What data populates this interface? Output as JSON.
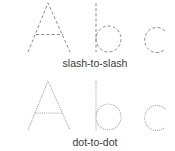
{
  "letters": [
    "A",
    "b",
    "c"
  ],
  "styles": [
    {
      "id": "slash",
      "label": "slash-to-slash",
      "stroke": "#8a8a8a",
      "dash": "3 2.2",
      "linecap": "butt"
    },
    {
      "id": "dot",
      "label": "dot-to-dot",
      "stroke": "#a6a6a6",
      "dash": "0.1 2",
      "linecap": "round"
    }
  ]
}
